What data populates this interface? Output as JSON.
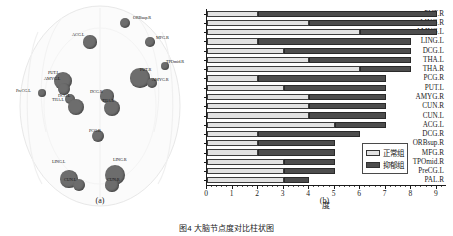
{
  "figure": {
    "caption": "图4  大脑节点度对比柱状图",
    "panel_a_label": "(a)",
    "panel_b_label": "(b)"
  },
  "panel_a": {
    "name": "brain-node-map",
    "nodes": [
      {
        "label": "ORBsup.R",
        "x": 125,
        "y": 23,
        "r": 5.0,
        "lx": 133,
        "ly": 15
      },
      {
        "label": "ACG.L",
        "x": 90,
        "y": 42,
        "r": 6.6,
        "lx": 72,
        "ly": 32
      },
      {
        "label": "MFG.R",
        "x": 150,
        "y": 42,
        "r": 4.8,
        "lx": 156,
        "ly": 35
      },
      {
        "label": "TPOmid.R",
        "x": 165,
        "y": 66,
        "r": 4.2,
        "lx": 166,
        "ly": 59
      },
      {
        "label": "PUT.R",
        "x": 140,
        "y": 78,
        "r": 9.6,
        "lx": 140,
        "ly": 67
      },
      {
        "label": "AMYG.R",
        "x": 152,
        "y": 83,
        "r": 5.0,
        "lx": 152,
        "ly": 77
      },
      {
        "label": "PUT.L",
        "x": 63,
        "y": 81,
        "r": 9.2,
        "lx": 48,
        "ly": 70
      },
      {
        "label": "AMYG.L",
        "x": 64,
        "y": 89,
        "r": 6.2,
        "lx": 44,
        "ly": 76
      },
      {
        "label": "PreCG.L",
        "x": 42,
        "y": 93,
        "r": 4.2,
        "lx": 16,
        "ly": 88
      },
      {
        "label": "DCG.L",
        "x": 70,
        "y": 99,
        "r": 5.4,
        "lx": 58,
        "ly": 93
      },
      {
        "label": "THA.L",
        "x": 76,
        "y": 107,
        "r": 8.2,
        "lx": 52,
        "ly": 97
      },
      {
        "label": "DCG.R",
        "x": 107,
        "y": 96,
        "r": 6.6,
        "lx": 90,
        "ly": 89
      },
      {
        "label": "THA.R",
        "x": 112,
        "y": 108,
        "r": 8.2,
        "lx": 102,
        "ly": 98
      },
      {
        "label": "PCG.R",
        "x": 98,
        "y": 136,
        "r": 6.2,
        "lx": 89,
        "ly": 128
      },
      {
        "label": "LING.L",
        "x": 69,
        "y": 179,
        "r": 8.6,
        "lx": 52,
        "ly": 159
      },
      {
        "label": "CUN.L",
        "x": 79,
        "y": 185,
        "r": 6.0,
        "lx": 64,
        "ly": 177
      },
      {
        "label": "LING.R",
        "x": 115,
        "y": 175,
        "r": 10.0,
        "lx": 113,
        "ly": 157
      },
      {
        "label": "CUN.R",
        "x": 112,
        "y": 185,
        "r": 6.6,
        "lx": 107,
        "ly": 177
      }
    ],
    "node_color": "#6d6d6d"
  },
  "chart_data": {
    "type": "bar",
    "orientation": "horizontal",
    "stacked": false,
    "title": "",
    "xlabel": "度",
    "ylabel": "",
    "xlim": [
      0,
      9.4
    ],
    "xticks": [
      0,
      1,
      2,
      3,
      4,
      5,
      6,
      7,
      8,
      9
    ],
    "grid": false,
    "legend_position": "bottom-right",
    "categories": [
      "PUT.R",
      "LING.R",
      "AMYG.L",
      "LING.L",
      "DCG.L",
      "THA.L",
      "THA.R",
      "PCG.R",
      "PUT.L",
      "AMYG.R",
      "CUN.R",
      "CUN.L",
      "ACG.L",
      "DCG.R",
      "ORBsup.R",
      "MFG.R",
      "TPOmid.R",
      "PreCG.L",
      "PAL.R"
    ],
    "series": [
      {
        "name": "正常组",
        "color": "#e2e2e2",
        "values": [
          2,
          4,
          6,
          2,
          3,
          4,
          6,
          2,
          3,
          4,
          4,
          4,
          5,
          2,
          2,
          2,
          3,
          3,
          3
        ]
      },
      {
        "name": "抑郁组",
        "color": "#4d4d4d",
        "values": [
          9,
          9,
          9,
          8,
          8,
          8,
          8,
          7,
          7,
          7,
          7,
          7,
          7,
          6,
          5,
          5,
          5,
          5,
          4
        ]
      }
    ]
  }
}
